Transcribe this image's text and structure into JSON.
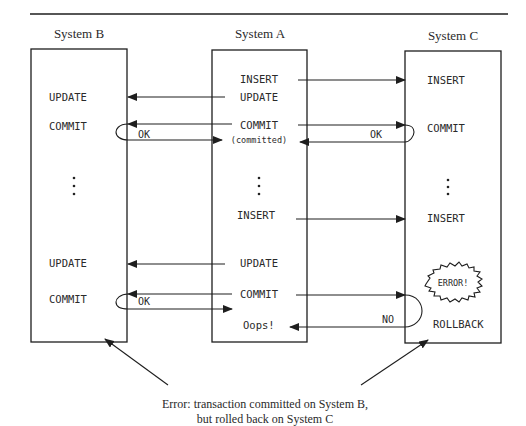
{
  "systems": {
    "b": {
      "label": "System B"
    },
    "a": {
      "label": "System A"
    },
    "c": {
      "label": "System C"
    }
  },
  "system_b": {
    "update1": "UPDATE",
    "commit1": "COMMIT",
    "update2": "UPDATE",
    "commit2": "COMMIT"
  },
  "system_a": {
    "insert1": "INSERT",
    "update1": "UPDATE",
    "commit1": "COMMIT",
    "committed": "(committed)",
    "insert2": "INSERT",
    "update2": "UPDATE",
    "commit2": "COMMIT",
    "oops": "Oops!"
  },
  "system_c": {
    "insert1": "INSERT",
    "commit1": "COMMIT",
    "insert2": "INSERT",
    "error": "ERROR!",
    "rollback": "ROLLBACK"
  },
  "responses": {
    "b_ok1": "OK",
    "c_ok1": "OK",
    "b_ok2": "OK",
    "c_no": "NO"
  },
  "caption": {
    "line1": "Error: transaction committed on System B,",
    "line2": "but rolled back on System C"
  }
}
